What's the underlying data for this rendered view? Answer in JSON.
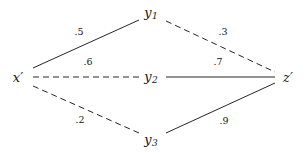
{
  "figure": {
    "type": "bipartite-path-diagram",
    "background_color": "#ffffff",
    "stroke_color": "#262626",
    "text_color": "#161616"
  },
  "nodes": [
    {
      "id": "x",
      "label_base": "x",
      "label_prime": "′",
      "subscript": "",
      "x": 18,
      "y": 77
    },
    {
      "id": "y1",
      "label_base": "y",
      "label_prime": "",
      "subscript": "1",
      "x": 151,
      "y": 13
    },
    {
      "id": "y2",
      "label_base": "y",
      "label_prime": "",
      "subscript": "2",
      "x": 151,
      "y": 77
    },
    {
      "id": "y3",
      "label_base": "y",
      "label_prime": "",
      "subscript": "3",
      "x": 151,
      "y": 140
    },
    {
      "id": "z",
      "label_base": "z",
      "label_prime": "′",
      "subscript": "",
      "x": 288,
      "y": 77
    }
  ],
  "edges": [
    {
      "id": "x-y1",
      "from": "x",
      "to": "y1",
      "style": "solid",
      "weight": ".5",
      "x1": 33,
      "y1": 68,
      "x2": 139,
      "y2": 20,
      "label_x": 79,
      "label_y": 32
    },
    {
      "id": "x-y2",
      "from": "x",
      "to": "y2",
      "style": "dashed",
      "weight": ".6",
      "x1": 33,
      "y1": 77,
      "x2": 139,
      "y2": 77,
      "label_x": 88,
      "label_y": 62
    },
    {
      "id": "x-y3",
      "from": "x",
      "to": "y3",
      "style": "dashed",
      "weight": ".2",
      "x1": 33,
      "y1": 86,
      "x2": 139,
      "y2": 133,
      "label_x": 80,
      "label_y": 120
    },
    {
      "id": "y1-z",
      "from": "y1",
      "to": "z",
      "style": "dashed",
      "weight": ".3",
      "x1": 166,
      "y1": 21,
      "x2": 275,
      "y2": 72,
      "label_x": 223,
      "label_y": 32
    },
    {
      "id": "y2-z",
      "from": "y2",
      "to": "z",
      "style": "solid",
      "weight": ".7",
      "x1": 166,
      "y1": 77,
      "x2": 275,
      "y2": 77,
      "label_x": 218,
      "label_y": 62
    },
    {
      "id": "y3-z",
      "from": "y3",
      "to": "z",
      "style": "solid",
      "weight": ".9",
      "x1": 166,
      "y1": 133,
      "x2": 275,
      "y2": 83,
      "label_x": 224,
      "label_y": 121
    }
  ]
}
